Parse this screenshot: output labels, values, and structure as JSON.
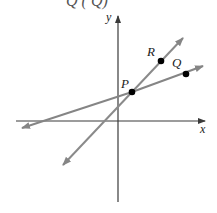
{
  "header_fragment": "Q (    Q)",
  "axes": {
    "x_label": "x",
    "y_label": "y",
    "color": "#3a3a3a"
  },
  "points": [
    {
      "name": "P",
      "label": "P",
      "px": [
        132,
        92
      ]
    },
    {
      "name": "Q",
      "label": "Q",
      "px": [
        186,
        74
      ]
    },
    {
      "name": "R",
      "label": "R",
      "px": [
        161,
        61
      ]
    }
  ],
  "lines": [
    {
      "name": "line-PQ",
      "through": [
        "P",
        "Q"
      ],
      "color": "#808080"
    },
    {
      "name": "line-PR",
      "through": [
        "P",
        "R"
      ],
      "color": "#8a8a8a"
    }
  ],
  "colors": {
    "point": "#000000",
    "line": "#858585",
    "axis": "#3a3a3a"
  }
}
